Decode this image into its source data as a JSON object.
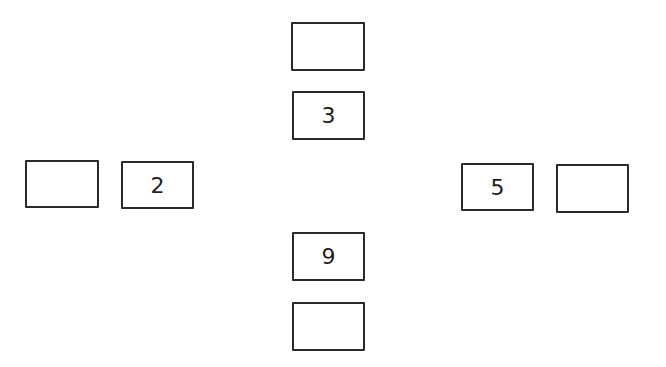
{
  "diagram": {
    "boxes": [
      {
        "id": "top-outer",
        "position": "top",
        "value": "",
        "x": 291,
        "y": 22,
        "w": 74,
        "h": 49
      },
      {
        "id": "top-inner",
        "position": "top",
        "value": "3",
        "x": 292,
        "y": 91,
        "w": 73,
        "h": 49
      },
      {
        "id": "left-outer",
        "position": "left",
        "value": "",
        "x": 25,
        "y": 160,
        "w": 74,
        "h": 48
      },
      {
        "id": "left-inner",
        "position": "left",
        "value": "2",
        "x": 121,
        "y": 161,
        "w": 73,
        "h": 48
      },
      {
        "id": "right-inner",
        "position": "right",
        "value": "5",
        "x": 461,
        "y": 163,
        "w": 73,
        "h": 48
      },
      {
        "id": "right-outer",
        "position": "right",
        "value": "",
        "x": 556,
        "y": 164,
        "w": 73,
        "h": 49
      },
      {
        "id": "bottom-inner",
        "position": "bottom",
        "value": "9",
        "x": 292,
        "y": 232,
        "w": 73,
        "h": 49
      },
      {
        "id": "bottom-outer",
        "position": "bottom",
        "value": "",
        "x": 292,
        "y": 302,
        "w": 73,
        "h": 49
      }
    ],
    "colors": {
      "stroke": "#2a2a2a",
      "text": "#1e1e1e",
      "background": "#ffffff"
    }
  }
}
